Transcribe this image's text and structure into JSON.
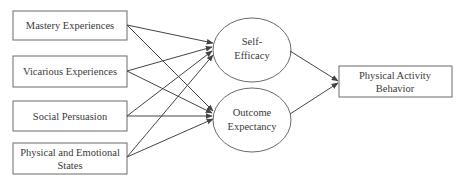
{
  "diagram": {
    "type": "path-model",
    "colors": {
      "stroke": "#555555",
      "text": "#3a3a3a",
      "background": "#ffffff"
    },
    "sources": [
      {
        "id": "mastery",
        "lines": [
          "Mastery Experiences"
        ]
      },
      {
        "id": "vicarious",
        "lines": [
          "Vicarious Experiences"
        ]
      },
      {
        "id": "social",
        "lines": [
          "Social Persuasion"
        ]
      },
      {
        "id": "physical",
        "lines": [
          "Physical and Emotional",
          "States"
        ]
      }
    ],
    "mediators": [
      {
        "id": "self_efficacy",
        "lines": [
          "Self-",
          "Efficacy"
        ]
      },
      {
        "id": "outcome_expectancy",
        "lines": [
          "Outcome",
          "Expectancy"
        ]
      }
    ],
    "outcome": {
      "id": "behavior",
      "lines": [
        "Physical Activity",
        "Behavior"
      ]
    },
    "edges": [
      {
        "from": "mastery",
        "to": "self_efficacy"
      },
      {
        "from": "mastery",
        "to": "outcome_expectancy"
      },
      {
        "from": "vicarious",
        "to": "self_efficacy"
      },
      {
        "from": "vicarious",
        "to": "outcome_expectancy"
      },
      {
        "from": "social",
        "to": "self_efficacy"
      },
      {
        "from": "social",
        "to": "outcome_expectancy"
      },
      {
        "from": "physical",
        "to": "self_efficacy"
      },
      {
        "from": "physical",
        "to": "outcome_expectancy"
      },
      {
        "from": "self_efficacy",
        "to": "behavior"
      },
      {
        "from": "outcome_expectancy",
        "to": "behavior"
      }
    ]
  }
}
